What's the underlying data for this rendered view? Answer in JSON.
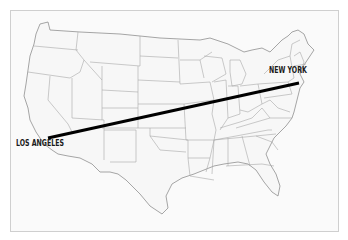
{
  "map": {
    "title": "United States",
    "colors": {
      "background": "#ffffff",
      "land_fill": "#f7f7f7",
      "state_border": "#9a9a9a",
      "frame_border": "#cfcfcf",
      "route_line": "#000000",
      "label_text": "#1a1a1a"
    },
    "cities": [
      {
        "name": "NEW YORK",
        "x": 299,
        "y": 83
      },
      {
        "name": "LOS ANGELES",
        "x": 48,
        "y": 138
      }
    ],
    "route": {
      "from": "LOS ANGELES",
      "to": "NEW YORK",
      "stroke_width": 3
    }
  }
}
